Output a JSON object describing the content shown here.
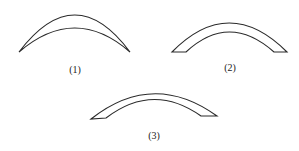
{
  "figure": {
    "background": "#ffffff",
    "stroke_color": "#2a2a2a",
    "shapes": [
      {
        "id": 1,
        "label": "(1)",
        "description": "crescent shape with pointed tips",
        "label_pos": {
          "x": 75,
          "y": 65
        },
        "path": "M19,52 Q75,-22 130,52 Q75,4 19,52 Z"
      },
      {
        "id": 2,
        "label": "(2)",
        "description": "arch band with flat ends",
        "label_pos": {
          "x": 230,
          "y": 63
        },
        "path": "M172,52 Q229,-6 287,52 L274,52 Q229,12 186,52 Z"
      },
      {
        "id": 3,
        "label": "(3)",
        "description": "arch band with slanted flat ends",
        "label_pos": {
          "x": 154,
          "y": 131
        },
        "path": "M91,119 Q153,70 217,116 L201,116 Q153,82 106,118 Z"
      }
    ]
  }
}
